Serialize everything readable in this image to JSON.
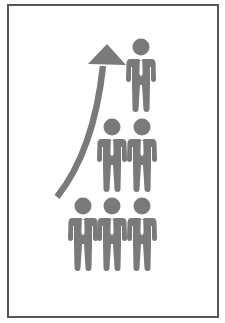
{
  "illustration": {
    "subject": "growth-pyramid-of-business-people",
    "colors": {
      "figure": "#7a7a7a",
      "tie": "#ffffff",
      "arrow": "#7a7a7a",
      "frame": "#555555",
      "background": "#ffffff"
    },
    "arrow": {
      "icon": "upward-curved-arrow-icon"
    },
    "rows": [
      {
        "name": "top-row",
        "count": 1
      },
      {
        "name": "middle-row",
        "count": 2
      },
      {
        "name": "bottom-row",
        "count": 3
      }
    ]
  }
}
